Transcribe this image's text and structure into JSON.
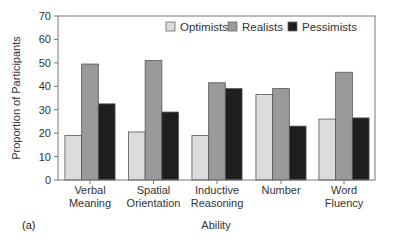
{
  "chart_data": {
    "type": "bar",
    "title": "",
    "panel_label": "(a)",
    "xlabel": "Ability",
    "ylabel": "Proportion of Participants",
    "ylim": [
      0,
      70
    ],
    "yticks": [
      0,
      10,
      20,
      30,
      40,
      50,
      60,
      70
    ],
    "grid": false,
    "legend_position": "top-right inside",
    "categories": [
      [
        "Verbal",
        "Meaning"
      ],
      [
        "Spatial",
        "Orientation"
      ],
      [
        "Inductive",
        "Reasoning"
      ],
      [
        "Number"
      ],
      [
        "Word",
        "Fluency"
      ]
    ],
    "series": [
      {
        "name": "Optimists",
        "color": "#dcdcdc",
        "values": [
          19,
          20.5,
          19,
          36.5,
          26
        ]
      },
      {
        "name": "Realists",
        "color": "#9a9a9a",
        "values": [
          49.5,
          51,
          41.5,
          39,
          46
        ]
      },
      {
        "name": "Pessimists",
        "color": "#1e1e1e",
        "values": [
          32.5,
          29,
          39,
          23,
          26.5
        ]
      }
    ]
  }
}
